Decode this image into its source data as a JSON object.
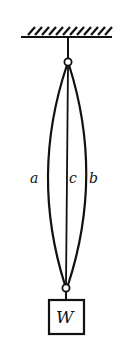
{
  "diagram": {
    "type": "mechanics",
    "labels": {
      "wire_a": "a",
      "wire_c": "c",
      "wire_b": "b",
      "weight": "W"
    },
    "colors": {
      "stroke": "#111111",
      "background": "#ffffff"
    }
  }
}
